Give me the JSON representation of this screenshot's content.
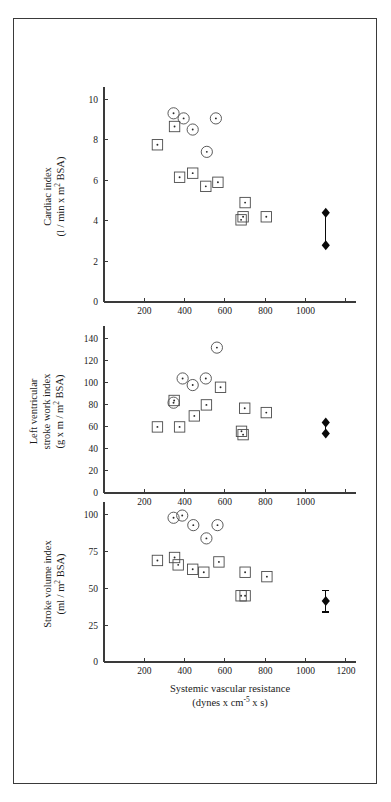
{
  "figure": {
    "xlabel_line1": "Systemic vascular resistance",
    "xlabel_line2_pre": "(dynes x cm",
    "xlabel_line2_sup": "-5",
    "xlabel_line2_post": " x s)",
    "x_ticks": [
      200,
      400,
      600,
      800,
      1000,
      1200
    ],
    "x_min": 0,
    "x_max": 1250,
    "frame_color": "#3a3a3a",
    "marker_color": "#4a4a4a",
    "summary_color": "#0a0a0a"
  },
  "chart_data": [
    {
      "type": "scatter",
      "panel": "top",
      "title": "",
      "ylabel_line1": "Cardiac index",
      "ylabel_line2_pre": "(l / min x m",
      "ylabel_line2_sup": "2",
      "ylabel_line2_post": " BSA)",
      "xlabel": "Systemic vascular resistance",
      "y_ticks": [
        0,
        2,
        4,
        6,
        8,
        10
      ],
      "ylim": [
        0,
        10.4
      ],
      "xlim": [
        0,
        1250
      ],
      "grid": false,
      "legend": "none",
      "series": [
        {
          "name": "circle-group",
          "marker": "circle-with-dot",
          "points": [
            {
              "x": 345,
              "y": 9.3
            },
            {
              "x": 395,
              "y": 9.05
            },
            {
              "x": 440,
              "y": 8.5
            },
            {
              "x": 555,
              "y": 9.05
            },
            {
              "x": 510,
              "y": 7.4
            }
          ]
        },
        {
          "name": "square-group",
          "marker": "square-with-dot",
          "points": [
            {
              "x": 265,
              "y": 7.75
            },
            {
              "x": 350,
              "y": 8.65
            },
            {
              "x": 375,
              "y": 6.15
            },
            {
              "x": 440,
              "y": 6.35
            },
            {
              "x": 505,
              "y": 5.7
            },
            {
              "x": 565,
              "y": 5.9
            },
            {
              "x": 700,
              "y": 4.9
            },
            {
              "x": 680,
              "y": 4.05
            },
            {
              "x": 690,
              "y": 4.2
            },
            {
              "x": 805,
              "y": 4.2
            }
          ]
        },
        {
          "name": "summary-diamonds",
          "marker": "diamond",
          "points": [
            {
              "x": 1100,
              "y": 4.4
            },
            {
              "x": 1100,
              "y": 2.8
            }
          ],
          "connector": {
            "x": 1100,
            "y_top": 4.4,
            "y_bottom": 2.8
          },
          "caps": false
        }
      ]
    },
    {
      "type": "scatter",
      "panel": "middle",
      "title": "",
      "ylabel_line1": "Left ventricular",
      "ylabel_line2": "stroke work index",
      "ylabel_line3_pre": "(g x m / m",
      "ylabel_line3_sup": "2",
      "ylabel_line3_post": " BSA)",
      "xlabel": "Systemic vascular resistance",
      "y_ticks": [
        0,
        20,
        40,
        60,
        80,
        100,
        120,
        140
      ],
      "ylim": [
        0,
        148
      ],
      "xlim": [
        0,
        1250
      ],
      "grid": false,
      "legend": "none",
      "series": [
        {
          "name": "circle-group",
          "marker": "circle-with-dot",
          "points": [
            {
              "x": 560,
              "y": 132
            },
            {
              "x": 390,
              "y": 104
            },
            {
              "x": 440,
              "y": 98
            },
            {
              "x": 505,
              "y": 104
            },
            {
              "x": 345,
              "y": 82
            }
          ]
        },
        {
          "name": "square-group",
          "marker": "square-with-dot",
          "points": [
            {
              "x": 348,
              "y": 84
            },
            {
              "x": 265,
              "y": 60
            },
            {
              "x": 375,
              "y": 60
            },
            {
              "x": 448,
              "y": 70
            },
            {
              "x": 508,
              "y": 80
            },
            {
              "x": 578,
              "y": 96
            },
            {
              "x": 698,
              "y": 77
            },
            {
              "x": 805,
              "y": 73
            },
            {
              "x": 682,
              "y": 56
            },
            {
              "x": 690,
              "y": 53
            }
          ]
        },
        {
          "name": "summary-diamonds",
          "marker": "diamond",
          "points": [
            {
              "x": 1100,
              "y": 64
            },
            {
              "x": 1100,
              "y": 54
            }
          ],
          "connector": {
            "x": 1100,
            "y_top": 64,
            "y_bottom": 54
          },
          "caps": false
        }
      ]
    },
    {
      "type": "scatter",
      "panel": "bottom",
      "title": "",
      "ylabel_line1": "Stroke volume index",
      "ylabel_line2_pre": "(ml / m",
      "ylabel_line2_sup": "2",
      "ylabel_line2_post": " BSA)",
      "xlabel": "Systemic vascular resistance",
      "y_ticks": [
        0,
        25,
        50,
        75,
        100
      ],
      "ylim": [
        0,
        106
      ],
      "xlim": [
        0,
        1250
      ],
      "grid": false,
      "legend": "none",
      "series": [
        {
          "name": "circle-group",
          "marker": "circle-with-dot",
          "points": [
            {
              "x": 345,
              "y": 98
            },
            {
              "x": 388,
              "y": 99.5
            },
            {
              "x": 443,
              "y": 93
            },
            {
              "x": 563,
              "y": 93
            },
            {
              "x": 508,
              "y": 84
            }
          ]
        },
        {
          "name": "square-group",
          "marker": "square-with-dot",
          "points": [
            {
              "x": 265,
              "y": 69
            },
            {
              "x": 350,
              "y": 71
            },
            {
              "x": 368,
              "y": 66
            },
            {
              "x": 440,
              "y": 63
            },
            {
              "x": 495,
              "y": 61
            },
            {
              "x": 570,
              "y": 68
            },
            {
              "x": 700,
              "y": 61
            },
            {
              "x": 808,
              "y": 58
            },
            {
              "x": 680,
              "y": 45
            },
            {
              "x": 700,
              "y": 45
            }
          ]
        },
        {
          "name": "summary-diamond",
          "marker": "diamond",
          "points": [
            {
              "x": 1100,
              "y": 41.5
            }
          ],
          "errorbar": {
            "x": 1100,
            "y_high": 48.5,
            "y_low": 34
          },
          "caps": true
        }
      ]
    }
  ]
}
